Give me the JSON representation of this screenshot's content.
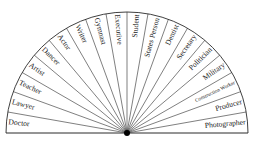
{
  "diagram": {
    "type": "semicircle-pendulum-chart",
    "center": {
      "x": 127,
      "y": 133
    },
    "radius": 121,
    "segment_count": 20,
    "colors": {
      "line": "#2a2a2a",
      "center": "#000000",
      "text": "#1a1a1a",
      "background": "#ffffff"
    },
    "segments": [
      {
        "label": "Doctor"
      },
      {
        "label": "Lawyer"
      },
      {
        "label": "Teacher"
      },
      {
        "label": "Artist"
      },
      {
        "label": "Dancer"
      },
      {
        "label": "Actor"
      },
      {
        "label": "Writer"
      },
      {
        "label": "Gymnast"
      },
      {
        "label": "Executive"
      },
      {
        "label": "Student"
      },
      {
        "label": "States Person"
      },
      {
        "label": "Dentist"
      },
      {
        "label": "Secretary"
      },
      {
        "label": "Politician"
      },
      {
        "label": "Military"
      },
      {
        "label": "Construction Worker"
      },
      {
        "label": "Producer"
      },
      {
        "label": "Photographer"
      }
    ]
  }
}
